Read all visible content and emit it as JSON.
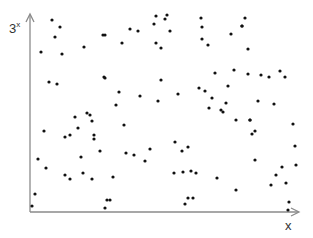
{
  "chart_data": {
    "type": "scatter",
    "title": "",
    "xlabel": "x",
    "ylabel": "3^x",
    "ylabel_base": "3",
    "ylabel_exponent": "x",
    "grid": false,
    "legend": null,
    "ticks": false,
    "axis_color": "#8a8a8a",
    "point_color": "#111111",
    "origin_px": [
      30,
      212
    ],
    "x_axis_end_px": 299,
    "y_axis_end_px": 14,
    "xlim": [
      0,
      270
    ],
    "ylim": [
      0,
      198
    ],
    "points": [
      [
        22,
        192
      ],
      [
        30,
        185
      ],
      [
        25,
        175
      ],
      [
        11,
        160
      ],
      [
        32,
        158
      ],
      [
        54,
        165
      ],
      [
        73,
        177
      ],
      [
        100,
        183
      ],
      [
        108,
        181
      ],
      [
        124,
        188
      ],
      [
        126,
        196
      ],
      [
        135,
        193
      ],
      [
        137,
        197
      ],
      [
        140,
        181
      ],
      [
        126,
        169
      ],
      [
        131,
        164
      ],
      [
        92,
        169
      ],
      [
        75,
        177
      ],
      [
        171,
        194
      ],
      [
        172,
        185
      ],
      [
        201,
        178
      ],
      [
        215,
        194
      ],
      [
        212,
        186
      ],
      [
        178,
        167
      ],
      [
        218,
        163
      ],
      [
        172,
        173
      ],
      [
        185,
        139
      ],
      [
        204,
        142
      ],
      [
        212,
        186
      ],
      [
        218,
        138
      ],
      [
        231,
        137
      ],
      [
        239,
        135
      ],
      [
        250,
        141
      ],
      [
        255,
        135
      ],
      [
        228,
        111
      ],
      [
        220,
        92
      ],
      [
        222,
        78
      ],
      [
        19,
        130
      ],
      [
        27,
        128
      ],
      [
        74,
        135
      ],
      [
        45,
        95
      ],
      [
        57,
        99
      ],
      [
        60,
        97
      ],
      [
        62,
        91
      ],
      [
        48,
        84
      ],
      [
        14,
        81
      ],
      [
        35,
        75
      ],
      [
        40,
        77
      ],
      [
        64,
        73
      ],
      [
        75,
        134
      ],
      [
        89,
        120
      ],
      [
        110,
        116
      ],
      [
        128,
        111
      ],
      [
        131,
        132
      ],
      [
        148,
        118
      ],
      [
        86,
        107
      ],
      [
        94,
        87
      ],
      [
        169,
        124
      ],
      [
        175,
        121
      ],
      [
        182,
        114
      ],
      [
        198,
        126
      ],
      [
        179,
        104
      ],
      [
        196,
        109
      ],
      [
        193,
        100
      ],
      [
        191,
        102
      ],
      [
        220,
        92
      ],
      [
        244,
        108
      ],
      [
        263,
        88
      ],
      [
        265,
        66
      ],
      [
        8,
        53
      ],
      [
        16,
        44
      ],
      [
        51,
        55
      ],
      [
        70,
        61
      ],
      [
        35,
        37
      ],
      [
        40,
        33
      ],
      [
        64,
        77
      ],
      [
        62,
        33
      ],
      [
        96,
        59
      ],
      [
        104,
        57
      ],
      [
        115,
        51
      ],
      [
        120,
        63
      ],
      [
        53,
        39
      ],
      [
        83,
        35
      ],
      [
        77,
        12
      ],
      [
        145,
        70
      ],
      [
        152,
        61
      ],
      [
        158,
        65
      ],
      [
        161,
        41
      ],
      [
        166,
        39
      ],
      [
        187,
        34
      ],
      [
        158,
        14
      ],
      [
        153,
        40
      ],
      [
        144,
        39
      ],
      [
        206,
        92
      ],
      [
        225,
        81
      ],
      [
        266,
        47
      ],
      [
        256,
        29
      ],
      [
        258,
        2
      ],
      [
        259,
        10
      ],
      [
        5,
        18
      ],
      [
        2,
        6
      ],
      [
        75,
        4
      ],
      [
        80,
        12
      ],
      [
        155,
        8
      ],
      [
        163,
        14
      ],
      [
        246,
        37
      ],
      [
        225,
        52
      ],
      [
        252,
        45
      ],
      [
        241,
        27
      ],
      [
        206,
        22
      ]
    ]
  }
}
